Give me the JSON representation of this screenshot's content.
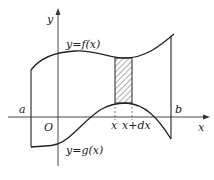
{
  "diagram": {
    "type": "area between curves",
    "labels": {
      "y_axis": "y",
      "x_axis": "x",
      "origin": "O",
      "left_bound": "a",
      "right_bound": "b",
      "upper_curve": "y=f(x)",
      "lower_curve": "y=g(x)",
      "strip_left": "x",
      "strip_right": "x+dx"
    },
    "colors": {
      "stroke": "#222222",
      "background": "#ffffff",
      "hatch": "#333333"
    }
  }
}
